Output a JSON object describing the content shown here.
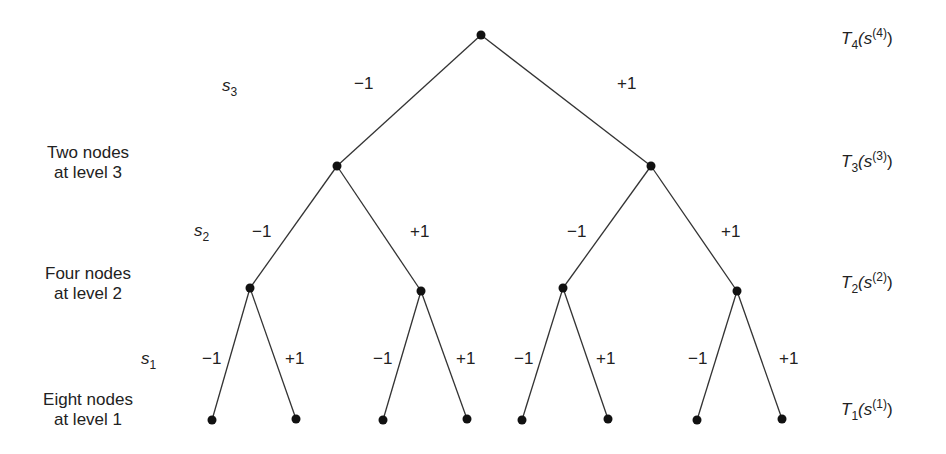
{
  "diagram": {
    "type": "binary-tree",
    "line_color": "#333333",
    "node_color": "#111111",
    "nodes": {
      "root": [
        481,
        35
      ],
      "level3": [
        [
          337,
          166
        ],
        [
          651,
          166
        ]
      ],
      "level2": [
        [
          250,
          288
        ],
        [
          421,
          291
        ],
        [
          563,
          288
        ],
        [
          737,
          291
        ]
      ],
      "level1": [
        [
          212,
          420
        ],
        [
          296,
          419
        ],
        [
          383,
          420
        ],
        [
          467,
          419
        ],
        [
          522,
          420
        ],
        [
          608,
          419
        ],
        [
          697,
          420
        ],
        [
          782,
          419
        ]
      ]
    },
    "edge_labels": {
      "s3": [
        "−1",
        "+1"
      ],
      "s2": [
        "−1",
        "+1",
        "−1",
        "+1"
      ],
      "s1": [
        "−1",
        "+1",
        "−1",
        "+1",
        "−1",
        "+1",
        "−1",
        "+1"
      ]
    },
    "variables": {
      "s3": {
        "base": "s",
        "sub": "3"
      },
      "s2": {
        "base": "s",
        "sub": "2"
      },
      "s1": {
        "base": "s",
        "sub": "1"
      }
    },
    "level_descriptions": {
      "level3": {
        "line1": "Two nodes",
        "line2": "at level 3"
      },
      "level2": {
        "line1": "Four nodes",
        "line2": "at level 2"
      },
      "level1": {
        "line1": "Eight nodes",
        "line2": "at level 1"
      }
    },
    "right_labels": {
      "t4": {
        "T": "T",
        "sub": "4",
        "s": "(s",
        "sup": "(4)",
        "close": ")"
      },
      "t3": {
        "T": "T",
        "sub": "3",
        "s": "(s",
        "sup": "(3)",
        "close": ")"
      },
      "t2": {
        "T": "T",
        "sub": "2",
        "s": "(s",
        "sup": "(2)",
        "close": ")"
      },
      "t1": {
        "T": "T",
        "sub": "1",
        "s": "(s",
        "sup": "(1)",
        "close": ")"
      }
    }
  }
}
